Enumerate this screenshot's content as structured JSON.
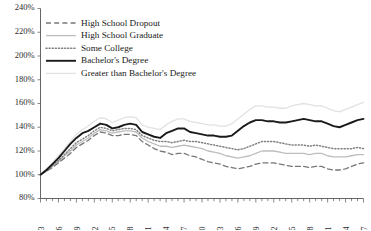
{
  "chart_data": {
    "type": "line",
    "title": "",
    "xlabel": "",
    "ylabel": "",
    "ylim": [
      80,
      240
    ],
    "xlim": [
      1963,
      2017
    ],
    "grid": false,
    "legend_position": "top-left",
    "ytick_labels": [
      "240%",
      "220%",
      "200%",
      "180%",
      "160%",
      "140%",
      "120%",
      "100%",
      "80%"
    ],
    "ytick_values": [
      240,
      220,
      200,
      180,
      160,
      140,
      120,
      100,
      80
    ],
    "xtick_labels": [
      "1963",
      "1966",
      "1969",
      "1972",
      "1975",
      "1978",
      "1981",
      "1984",
      "1987",
      "1990",
      "1993",
      "1996",
      "1999",
      "2002",
      "2005",
      "2008",
      "2011",
      "2014",
      "2017"
    ],
    "xtick_values": [
      1963,
      1966,
      1969,
      1972,
      1975,
      1978,
      1981,
      1984,
      1987,
      1990,
      1993,
      1996,
      1999,
      2002,
      2005,
      2008,
      2011,
      2014,
      2017
    ],
    "x": [
      1963,
      1964,
      1965,
      1966,
      1967,
      1968,
      1969,
      1970,
      1971,
      1972,
      1973,
      1974,
      1975,
      1976,
      1977,
      1978,
      1979,
      1980,
      1981,
      1982,
      1983,
      1984,
      1985,
      1986,
      1987,
      1988,
      1989,
      1990,
      1991,
      1992,
      1993,
      1994,
      1995,
      1996,
      1997,
      1998,
      1999,
      2000,
      2001,
      2002,
      2003,
      2004,
      2005,
      2006,
      2007,
      2008,
      2009,
      2010,
      2011,
      2012,
      2013,
      2014,
      2015,
      2016,
      2017
    ],
    "series": [
      {
        "name": "High School Dropout",
        "style": "dashed",
        "color": "#777777",
        "width": 1.3,
        "values": [
          100,
          103,
          106,
          110,
          114,
          118,
          123,
          126,
          129,
          133,
          136,
          135,
          133,
          133,
          134,
          134,
          133,
          128,
          125,
          122,
          120,
          119,
          117,
          118,
          118,
          116,
          115,
          113,
          111,
          110,
          109,
          107,
          106,
          105,
          106,
          107,
          109,
          110,
          110,
          110,
          109,
          108,
          107,
          107,
          107,
          106,
          107,
          107,
          105,
          104,
          104,
          105,
          107,
          109,
          110
        ]
      },
      {
        "name": "High School Graduate",
        "style": "solid-light",
        "color": "#bdbdbd",
        "width": 1.3,
        "values": [
          100,
          103,
          107,
          111,
          116,
          120,
          125,
          128,
          131,
          135,
          138,
          137,
          135,
          136,
          137,
          137,
          136,
          131,
          128,
          126,
          124,
          124,
          123,
          124,
          125,
          124,
          123,
          122,
          120,
          119,
          118,
          116,
          115,
          114,
          115,
          116,
          118,
          120,
          120,
          120,
          119,
          118,
          118,
          118,
          118,
          117,
          118,
          118,
          116,
          115,
          115,
          115,
          116,
          117,
          117
        ]
      },
      {
        "name": "Some College",
        "style": "dotted",
        "color": "#808080",
        "width": 1.5,
        "values": [
          100,
          104,
          108,
          112,
          117,
          122,
          127,
          130,
          133,
          137,
          140,
          139,
          137,
          138,
          139,
          139,
          138,
          133,
          131,
          129,
          128,
          128,
          127,
          128,
          129,
          128,
          128,
          127,
          126,
          125,
          124,
          123,
          122,
          121,
          122,
          124,
          126,
          128,
          128,
          128,
          127,
          126,
          125,
          125,
          125,
          124,
          125,
          124,
          123,
          122,
          122,
          122,
          122,
          123,
          122
        ]
      },
      {
        "name": "Bachelor's Degree",
        "style": "solid-dark",
        "color": "#1a1a1a",
        "width": 1.9,
        "values": [
          100,
          104,
          109,
          114,
          120,
          126,
          131,
          135,
          137,
          140,
          143,
          142,
          139,
          140,
          142,
          143,
          142,
          136,
          134,
          132,
          131,
          135,
          137,
          139,
          139,
          136,
          135,
          134,
          133,
          133,
          132,
          132,
          133,
          137,
          141,
          144,
          146,
          146,
          145,
          145,
          144,
          144,
          145,
          146,
          147,
          146,
          145,
          145,
          143,
          141,
          140,
          142,
          144,
          146,
          147
        ]
      },
      {
        "name": "Greater than Bachelor's Degree",
        "style": "solid-faint",
        "color": "#e2e2e2",
        "width": 1.3,
        "values": [
          100,
          105,
          110,
          116,
          122,
          128,
          134,
          138,
          141,
          145,
          148,
          147,
          144,
          146,
          148,
          149,
          148,
          142,
          140,
          139,
          138,
          142,
          145,
          147,
          147,
          145,
          144,
          143,
          142,
          142,
          141,
          141,
          143,
          147,
          151,
          155,
          158,
          158,
          157,
          157,
          156,
          156,
          158,
          159,
          160,
          159,
          158,
          158,
          156,
          154,
          153,
          155,
          157,
          159,
          161
        ]
      }
    ]
  },
  "legend": {
    "items": [
      {
        "label": "High School Dropout"
      },
      {
        "label": "High School Graduate"
      },
      {
        "label": "Some College"
      },
      {
        "label": "Bachelor's Degree"
      },
      {
        "label": "Greater than Bachelor's Degree"
      }
    ]
  }
}
